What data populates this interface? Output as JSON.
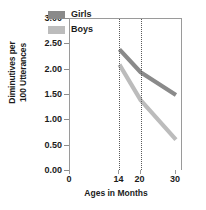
{
  "chart_data": {
    "type": "line",
    "title": "",
    "xlabel": "Ages in Months",
    "ylabel": "Diminutives per\n100 Utterances",
    "xlim": [
      0,
      32
    ],
    "ylim": [
      0.0,
      3.0
    ],
    "x_ticks": [
      0,
      14,
      20,
      30
    ],
    "x_tick_labels": [
      "0",
      "14",
      "20",
      "30"
    ],
    "y_ticks": [
      0.0,
      0.5,
      1.0,
      1.5,
      2.0,
      2.5,
      3.0
    ],
    "y_tick_labels": [
      "0.00",
      "0.50",
      "1.00",
      "1.50",
      "2.00",
      "2.50",
      "3.00"
    ],
    "grid": false,
    "legend_position": "top-right",
    "reference_lines": [
      {
        "name": "ref-line-14",
        "x": 14,
        "style": "dotted"
      },
      {
        "name": "ref-line-20",
        "x": 20,
        "style": "dotted"
      }
    ],
    "x": [
      14,
      20,
      30
    ],
    "series": [
      {
        "name": "Girls",
        "color": "#8a8a8a",
        "values": [
          2.4,
          1.95,
          1.5
        ]
      },
      {
        "name": "Boys",
        "color": "#bcbcbc",
        "values": [
          2.1,
          1.4,
          0.62
        ]
      }
    ]
  },
  "legend": {
    "items": [
      {
        "label": "Girls",
        "color": "#8a8a8a"
      },
      {
        "label": "Boys",
        "color": "#bcbcbc"
      }
    ]
  },
  "axes": {
    "y_title": "Diminutives per\n100 Utterances",
    "x_title": "Ages in Months"
  }
}
